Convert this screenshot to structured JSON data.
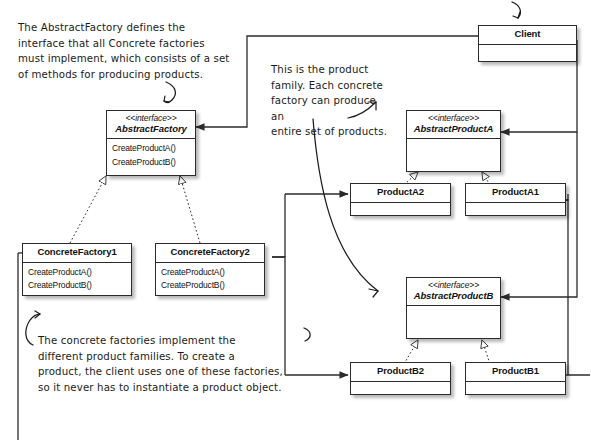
{
  "diagram": {
    "background": "#ffffff",
    "line_color": "#2b2b2b",
    "text_color": "#111111",
    "note_color": "#1a1a1a"
  },
  "stereotype": "<<interface>>",
  "classes": {
    "abstract_factory": {
      "stereotype": "<<interface>>",
      "name": "AbstractFactory",
      "operations": [
        "CreateProductA()",
        "CreateProductB()"
      ]
    },
    "concrete_factory_1": {
      "name": "ConcreteFactory1",
      "operations": [
        "CreateProductA()",
        "CreateProductB()"
      ]
    },
    "concrete_factory_2": {
      "name": "ConcreteFactory2",
      "operations": [
        "CreateProductA()",
        "CreateProductB()"
      ]
    },
    "client": {
      "name": "Client",
      "operations": []
    },
    "abstract_product_a": {
      "stereotype": "<<interface>>",
      "name": "AbstractProductA",
      "operations": []
    },
    "product_a2": {
      "name": "ProductA2",
      "operations": []
    },
    "product_a1": {
      "name": "ProductA1",
      "operations": []
    },
    "abstract_product_b": {
      "stereotype": "<<interface>>",
      "name": "AbstractProductB",
      "operations": []
    },
    "product_b2": {
      "name": "ProductB2",
      "operations": []
    },
    "product_b1": {
      "name": "ProductB1",
      "operations": []
    }
  },
  "notes": {
    "abstract_factory_note": "The AbstractFactory defines the\ninterface that all Concrete factories\nmust implement, which consists of a set\nof methods for producing products.",
    "product_family_note": "This is the product\nfamily.  Each concrete\nfactory can produce an\nentire set of products.",
    "concrete_factories_note": "The concrete factories implement the\ndifferent product families.  To create a\nproduct, the client uses one of these factories,\nso it never has to instantiate a product object."
  },
  "relationships": [
    {
      "from": "ConcreteFactory1",
      "to": "AbstractFactory",
      "type": "realization"
    },
    {
      "from": "ConcreteFactory2",
      "to": "AbstractFactory",
      "type": "realization"
    },
    {
      "from": "ProductA2",
      "to": "AbstractProductA",
      "type": "realization"
    },
    {
      "from": "ProductA1",
      "to": "AbstractProductA",
      "type": "realization"
    },
    {
      "from": "ProductB2",
      "to": "AbstractProductB",
      "type": "realization"
    },
    {
      "from": "ProductB1",
      "to": "AbstractProductB",
      "type": "realization"
    },
    {
      "from": "Client",
      "to": "AbstractFactory",
      "type": "association"
    },
    {
      "from": "Client",
      "to": "AbstractProductA",
      "type": "association"
    },
    {
      "from": "Client",
      "to": "AbstractProductB",
      "type": "association"
    },
    {
      "from": "ConcreteFactory1",
      "to": "ProductA1",
      "type": "association"
    },
    {
      "from": "ConcreteFactory1",
      "to": "ProductB1",
      "type": "association"
    },
    {
      "from": "ConcreteFactory2",
      "to": "ProductA2",
      "type": "association"
    },
    {
      "from": "ConcreteFactory2",
      "to": "ProductB2",
      "type": "association"
    }
  ]
}
